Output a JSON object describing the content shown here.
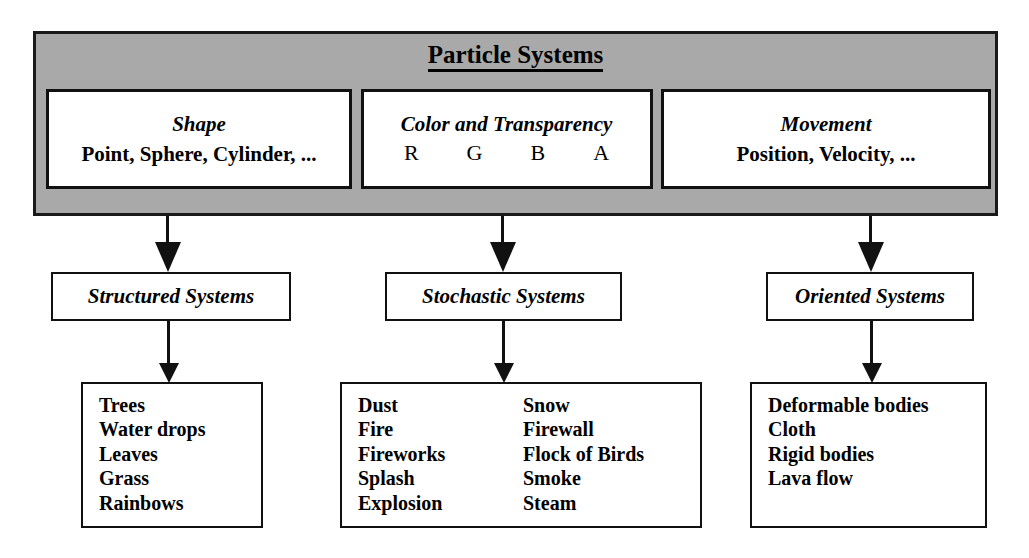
{
  "diagram": {
    "title": "Particle Systems",
    "accent_gray": "#a9a9a9",
    "line_color": "#111111",
    "attributes": [
      {
        "name": "shape",
        "title": "Shape",
        "subtitle": "Point, Sphere, Cylinder, ..."
      },
      {
        "name": "color",
        "title": "Color and Transparency",
        "channels": [
          "R",
          "G",
          "B",
          "A"
        ]
      },
      {
        "name": "movement",
        "title": "Movement",
        "subtitle": "Position, Velocity, ..."
      }
    ],
    "categories": [
      {
        "name": "structured",
        "label": "Structured Systems"
      },
      {
        "name": "stochastic",
        "label": "Stochastic Systems"
      },
      {
        "name": "oriented",
        "label": "Oriented Systems"
      }
    ],
    "examples": [
      {
        "name": "structured-examples",
        "columns": [
          [
            "Trees",
            "Water drops",
            "Leaves",
            "Grass",
            "Rainbows"
          ]
        ]
      },
      {
        "name": "stochastic-examples",
        "columns": [
          [
            "Dust",
            "Fire",
            "Fireworks",
            "Splash",
            "Explosion"
          ],
          [
            "Snow",
            "Firewall",
            "Flock of Birds",
            "Smoke",
            "Steam"
          ]
        ]
      },
      {
        "name": "oriented-examples",
        "columns": [
          [
            "Deformable bodies",
            "Cloth",
            "Rigid bodies",
            "Lava flow"
          ]
        ]
      }
    ]
  }
}
